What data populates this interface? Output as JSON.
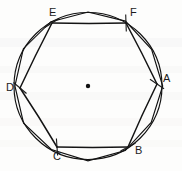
{
  "figure": {
    "kind": "geometry-diagram",
    "background_color": "#fdfdfc",
    "stroke_color": "#111111",
    "label_color": "#1b1b1b"
  },
  "chart_data": {
    "type": "scatter",
    "title": "",
    "xlabel": "",
    "ylabel": "",
    "grid": false,
    "legend": "none",
    "circle": {
      "center": [
        88,
        86
      ],
      "radius": 74,
      "label": ""
    },
    "center_marker": {
      "shape": "dot",
      "position": [
        88,
        86
      ],
      "radius": 2.2
    },
    "vertices": [
      {
        "label": "A",
        "position": [
          157,
          84
        ],
        "label_offset": [
          6,
          -11
        ],
        "tick_angle": 34
      },
      {
        "label": "B",
        "position": [
          128,
          147
        ],
        "label_offset": [
          7,
          -2
        ],
        "tick_angle": -28
      },
      {
        "label": "C",
        "position": [
          57,
          147
        ],
        "label_offset": [
          -4,
          4
        ],
        "tick_angle": 86
      },
      {
        "label": "D",
        "position": [
          20,
          88
        ],
        "label_offset": [
          -14,
          -6
        ],
        "tick_angle": 40
      },
      {
        "label": "E",
        "position": [
          52,
          23
        ],
        "label_offset": [
          -3,
          -16
        ],
        "tick_angle": -32
      },
      {
        "label": "F",
        "position": [
          126,
          23
        ],
        "label_offset": [
          4,
          -16
        ],
        "tick_angle": 88
      }
    ],
    "edges": [
      {
        "from": "A",
        "to": "B"
      },
      {
        "from": "B",
        "to": "C"
      },
      {
        "from": "C",
        "to": "D"
      },
      {
        "from": "D",
        "to": "E"
      },
      {
        "from": "E",
        "to": "F"
      },
      {
        "from": "F",
        "to": "A"
      }
    ],
    "labels": [
      "A",
      "B",
      "C",
      "D",
      "E",
      "F"
    ]
  }
}
